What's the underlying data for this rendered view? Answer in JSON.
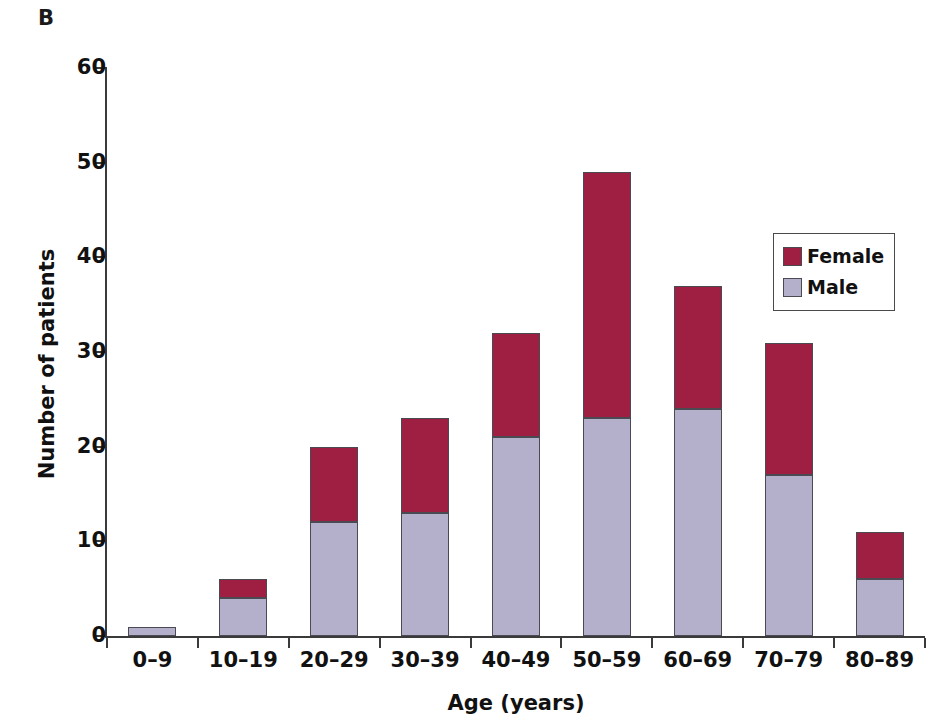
{
  "panel": {
    "label": "B"
  },
  "chart_data": {
    "type": "bar",
    "subtype": "stacked-vertical",
    "title": "",
    "xlabel": "Age (years)",
    "ylabel": "Number of patients",
    "categories": [
      "0–9",
      "10–19",
      "20–29",
      "30–39",
      "40–49",
      "50–59",
      "60–69",
      "70–79",
      "80–89"
    ],
    "series": [
      {
        "name": "Male",
        "color": "#b4afcb",
        "values": [
          1,
          4,
          12,
          13,
          21,
          23,
          24,
          17,
          6
        ]
      },
      {
        "name": "Female",
        "color": "#9e1f41",
        "values": [
          0,
          2,
          8,
          10,
          11,
          26,
          13,
          14,
          5
        ]
      }
    ],
    "stack_order": [
      "Male",
      "Female"
    ],
    "totals": [
      1,
      6,
      20,
      23,
      32,
      49,
      37,
      31,
      11
    ],
    "ylim": [
      0,
      60
    ],
    "yticks": [
      0,
      10,
      20,
      30,
      40,
      50,
      60
    ],
    "ytick_labels": [
      "0",
      "10",
      "20",
      "30",
      "40",
      "50",
      "60"
    ],
    "grid": false,
    "legend_position": "upper right",
    "legend_entries": [
      "Female",
      "Male"
    ]
  },
  "legend": {
    "items": [
      {
        "label": "Female",
        "color": "#9e1f41"
      },
      {
        "label": "Male",
        "color": "#b4afcb"
      }
    ]
  }
}
